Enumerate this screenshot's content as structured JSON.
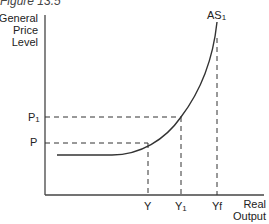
{
  "caption": "Figure 13.5",
  "y_axis_label": [
    "General",
    "Price",
    "Level"
  ],
  "x_axis_label": [
    "Real",
    "Output"
  ],
  "curve_label": "AS",
  "curve_label_sub": "1",
  "price_levels": [
    {
      "label": "P",
      "sub": "1"
    },
    {
      "label": "P",
      "sub": ""
    }
  ],
  "output_levels": [
    {
      "label": "Y",
      "sub": ""
    },
    {
      "label": "Y",
      "sub": "1"
    },
    {
      "label": "Y",
      "sub": "f"
    }
  ]
}
